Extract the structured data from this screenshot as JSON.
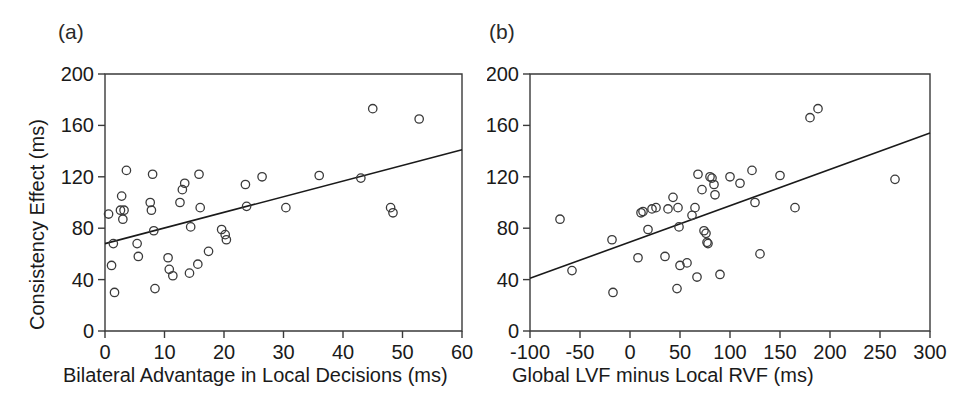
{
  "figure": {
    "background": "#ffffff",
    "axis_color": "#3a3a3a",
    "marker_color": "#3a3a3a",
    "line_color": "#1a1a1a"
  },
  "panels": {
    "a": {
      "letter": "(a)",
      "xlabel": "Bilateral Advantage in Local Decisions (ms)",
      "ylabel": "Consistency Effect (ms)"
    },
    "b": {
      "letter": "(b)",
      "xlabel": "Global LVF minus Local RVF (ms)",
      "ylabel": "Consistency Effect (ms)"
    }
  },
  "chart_data": [
    {
      "type": "scatter",
      "panel": "a",
      "title": "(a)",
      "xlabel": "Bilateral Advantage in Local Decisions (ms)",
      "ylabel": "Consistency Effect (ms)",
      "xlim": [
        0,
        60
      ],
      "ylim": [
        0,
        200
      ],
      "xticks": [
        0,
        10,
        20,
        30,
        40,
        50,
        60
      ],
      "xticklabels": [
        "0",
        "10",
        "20",
        "30",
        "40",
        "50",
        "60"
      ],
      "yticks": [
        0,
        40,
        80,
        120,
        160,
        200
      ],
      "yticklabels": [
        "0",
        "40",
        "80",
        "120",
        "160",
        "200"
      ],
      "grid": false,
      "legend": null,
      "marker": "open-circle",
      "points": [
        {
          "x": 0.6,
          "y": 91
        },
        {
          "x": 1.1,
          "y": 51
        },
        {
          "x": 1.4,
          "y": 68
        },
        {
          "x": 1.6,
          "y": 30
        },
        {
          "x": 2.6,
          "y": 94
        },
        {
          "x": 2.8,
          "y": 105
        },
        {
          "x": 3.0,
          "y": 87
        },
        {
          "x": 3.2,
          "y": 94
        },
        {
          "x": 3.6,
          "y": 125
        },
        {
          "x": 5.4,
          "y": 68
        },
        {
          "x": 5.6,
          "y": 58
        },
        {
          "x": 7.6,
          "y": 100
        },
        {
          "x": 7.8,
          "y": 94
        },
        {
          "x": 8.0,
          "y": 122
        },
        {
          "x": 8.2,
          "y": 78
        },
        {
          "x": 8.4,
          "y": 33
        },
        {
          "x": 10.6,
          "y": 57
        },
        {
          "x": 10.8,
          "y": 48
        },
        {
          "x": 11.4,
          "y": 43
        },
        {
          "x": 12.6,
          "y": 100
        },
        {
          "x": 13.0,
          "y": 110
        },
        {
          "x": 13.4,
          "y": 115
        },
        {
          "x": 14.2,
          "y": 45
        },
        {
          "x": 14.4,
          "y": 81
        },
        {
          "x": 15.6,
          "y": 52
        },
        {
          "x": 15.8,
          "y": 122
        },
        {
          "x": 16.0,
          "y": 96
        },
        {
          "x": 17.4,
          "y": 62
        },
        {
          "x": 19.6,
          "y": 79
        },
        {
          "x": 20.2,
          "y": 75
        },
        {
          "x": 20.4,
          "y": 71
        },
        {
          "x": 23.6,
          "y": 114
        },
        {
          "x": 23.8,
          "y": 97
        },
        {
          "x": 26.4,
          "y": 120
        },
        {
          "x": 30.4,
          "y": 96
        },
        {
          "x": 36.0,
          "y": 121
        },
        {
          "x": 43.0,
          "y": 119
        },
        {
          "x": 45.0,
          "y": 173
        },
        {
          "x": 48.0,
          "y": 96
        },
        {
          "x": 48.4,
          "y": 92
        },
        {
          "x": 52.8,
          "y": 165
        }
      ],
      "fit_line": {
        "x": [
          0,
          60
        ],
        "y": [
          68,
          141
        ]
      }
    },
    {
      "type": "scatter",
      "panel": "b",
      "title": "(b)",
      "xlabel": "Global LVF minus Local RVF (ms)",
      "ylabel": "Consistency Effect (ms)",
      "xlim": [
        -100,
        300
      ],
      "ylim": [
        0,
        200
      ],
      "xticks": [
        -100,
        -50,
        0,
        50,
        100,
        150,
        200,
        250,
        300
      ],
      "xticklabels": [
        "-100",
        "-50",
        "0",
        "50",
        "100",
        "150",
        "200",
        "250",
        "300"
      ],
      "yticks": [
        0,
        40,
        80,
        120,
        160,
        200
      ],
      "yticklabels": [
        "0",
        "40",
        "80",
        "120",
        "160",
        "200"
      ],
      "grid": false,
      "legend": null,
      "marker": "open-circle",
      "points": [
        {
          "x": -70,
          "y": 87
        },
        {
          "x": -58,
          "y": 47
        },
        {
          "x": -18,
          "y": 71
        },
        {
          "x": -17,
          "y": 30
        },
        {
          "x": 8,
          "y": 57
        },
        {
          "x": 11,
          "y": 92
        },
        {
          "x": 13,
          "y": 93
        },
        {
          "x": 18,
          "y": 79
        },
        {
          "x": 22,
          "y": 95
        },
        {
          "x": 26,
          "y": 96
        },
        {
          "x": 35,
          "y": 58
        },
        {
          "x": 38,
          "y": 95
        },
        {
          "x": 43,
          "y": 104
        },
        {
          "x": 47,
          "y": 33
        },
        {
          "x": 48,
          "y": 96
        },
        {
          "x": 49,
          "y": 81
        },
        {
          "x": 50,
          "y": 51
        },
        {
          "x": 57,
          "y": 53
        },
        {
          "x": 62,
          "y": 90
        },
        {
          "x": 65,
          "y": 96
        },
        {
          "x": 67,
          "y": 42
        },
        {
          "x": 68,
          "y": 122
        },
        {
          "x": 72,
          "y": 110
        },
        {
          "x": 74,
          "y": 78
        },
        {
          "x": 76,
          "y": 76
        },
        {
          "x": 77,
          "y": 69
        },
        {
          "x": 78,
          "y": 68
        },
        {
          "x": 80,
          "y": 120
        },
        {
          "x": 82,
          "y": 119
        },
        {
          "x": 84,
          "y": 114
        },
        {
          "x": 85,
          "y": 106
        },
        {
          "x": 90,
          "y": 44
        },
        {
          "x": 100,
          "y": 120
        },
        {
          "x": 110,
          "y": 115
        },
        {
          "x": 122,
          "y": 125
        },
        {
          "x": 125,
          "y": 100
        },
        {
          "x": 130,
          "y": 60
        },
        {
          "x": 150,
          "y": 121
        },
        {
          "x": 165,
          "y": 96
        },
        {
          "x": 180,
          "y": 166
        },
        {
          "x": 188,
          "y": 173
        },
        {
          "x": 265,
          "y": 118
        }
      ],
      "fit_line": {
        "x": [
          -100,
          300
        ],
        "y": [
          41,
          154
        ]
      }
    }
  ]
}
